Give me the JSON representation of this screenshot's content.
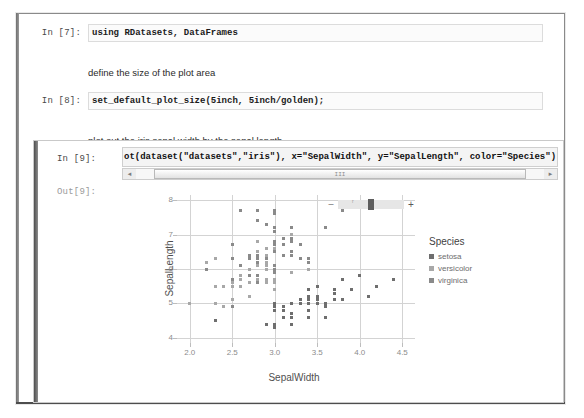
{
  "notebook": {
    "cells": [
      {
        "prompt": "In [7]:",
        "type": "code",
        "source": "using RDatasets, DataFrames"
      },
      {
        "prompt": "",
        "type": "markdown",
        "source": "define the size of the plot area"
      },
      {
        "prompt": "In [8]:",
        "type": "code",
        "source": "set_default_plot_size(5inch, 5inch/golden);"
      },
      {
        "prompt": "",
        "type": "markdown",
        "source": "plot out the iris sepal width by the sepal length"
      }
    ],
    "active_cell": {
      "prompt": "In [9]:",
      "source": "ot(dataset(\"datasets\",\"iris\"), x=\"SepalWidth\", y=\"SepalLength\", color=\"Species\")",
      "output_prompt": "Out[9]:",
      "scrollbar": {
        "left_arrow": "◄",
        "right_arrow": "►",
        "grip": "III"
      }
    }
  },
  "plot_controls": {
    "zoom_out_label": "–",
    "zoom_in_label": "+",
    "slider_name": "zoom-slider"
  },
  "chart_data": {
    "type": "scatter",
    "title": "",
    "xlabel": "SepalWidth",
    "ylabel": "SepalLength",
    "xlim": [
      1.85,
      4.65
    ],
    "ylim": [
      3.85,
      8.15
    ],
    "xticks": [
      "2.0",
      "2.5",
      "3.0",
      "3.5",
      "4.0",
      "4.5"
    ],
    "xtick_values": [
      2.0,
      2.5,
      3.0,
      3.5,
      4.0,
      4.5
    ],
    "yticks": [
      "4",
      "5",
      "6",
      "7",
      "8"
    ],
    "ytick_values": [
      4,
      5,
      6,
      7,
      8
    ],
    "grid": true,
    "legend": {
      "title": "Species",
      "position": "right",
      "entries": [
        {
          "label": "setosa",
          "color": "#6e6e6e"
        },
        {
          "label": "versicolor",
          "color": "#a8a8a8"
        },
        {
          "label": "virginica",
          "color": "#8a8a8a"
        }
      ]
    },
    "series": [
      {
        "name": "setosa",
        "color": "#6e6e6e",
        "points": [
          [
            3.5,
            5.1
          ],
          [
            3.0,
            4.9
          ],
          [
            3.2,
            4.7
          ],
          [
            3.1,
            4.6
          ],
          [
            3.6,
            5.0
          ],
          [
            3.9,
            5.4
          ],
          [
            3.4,
            4.6
          ],
          [
            3.4,
            5.0
          ],
          [
            2.9,
            4.4
          ],
          [
            3.1,
            4.9
          ],
          [
            3.7,
            5.4
          ],
          [
            3.4,
            4.8
          ],
          [
            3.0,
            4.8
          ],
          [
            3.0,
            4.3
          ],
          [
            4.0,
            5.8
          ],
          [
            4.4,
            5.7
          ],
          [
            3.9,
            5.4
          ],
          [
            3.5,
            5.1
          ],
          [
            3.8,
            5.7
          ],
          [
            3.8,
            5.1
          ],
          [
            3.4,
            5.4
          ],
          [
            3.7,
            5.1
          ],
          [
            3.6,
            4.6
          ],
          [
            3.3,
            5.1
          ],
          [
            3.4,
            4.8
          ],
          [
            3.0,
            5.0
          ],
          [
            3.4,
            5.0
          ],
          [
            3.5,
            5.2
          ],
          [
            3.4,
            5.2
          ],
          [
            3.2,
            4.7
          ],
          [
            3.1,
            4.8
          ],
          [
            3.4,
            5.4
          ],
          [
            4.1,
            5.2
          ],
          [
            4.2,
            5.5
          ],
          [
            3.1,
            4.9
          ],
          [
            3.2,
            5.0
          ],
          [
            3.5,
            5.5
          ],
          [
            3.6,
            4.9
          ],
          [
            3.0,
            4.4
          ],
          [
            3.4,
            5.1
          ],
          [
            3.5,
            5.0
          ],
          [
            2.3,
            4.5
          ],
          [
            3.2,
            4.4
          ],
          [
            3.5,
            5.0
          ],
          [
            3.8,
            5.1
          ],
          [
            3.0,
            4.8
          ],
          [
            3.8,
            5.1
          ],
          [
            3.2,
            4.6
          ],
          [
            3.7,
            5.3
          ],
          [
            3.3,
            5.0
          ]
        ]
      },
      {
        "name": "versicolor",
        "color": "#a8a8a8",
        "points": [
          [
            3.2,
            7.0
          ],
          [
            3.2,
            6.4
          ],
          [
            3.1,
            6.9
          ],
          [
            2.3,
            5.5
          ],
          [
            2.8,
            6.5
          ],
          [
            2.8,
            5.7
          ],
          [
            3.3,
            6.3
          ],
          [
            2.4,
            4.9
          ],
          [
            2.9,
            6.6
          ],
          [
            2.7,
            5.2
          ],
          [
            2.0,
            5.0
          ],
          [
            3.0,
            5.9
          ],
          [
            2.2,
            6.0
          ],
          [
            2.9,
            6.1
          ],
          [
            2.9,
            5.6
          ],
          [
            3.1,
            6.7
          ],
          [
            3.0,
            5.6
          ],
          [
            2.7,
            5.8
          ],
          [
            2.2,
            6.2
          ],
          [
            2.5,
            5.6
          ],
          [
            3.2,
            5.9
          ],
          [
            2.8,
            6.1
          ],
          [
            2.5,
            6.3
          ],
          [
            2.8,
            6.1
          ],
          [
            2.9,
            6.4
          ],
          [
            3.0,
            6.6
          ],
          [
            2.8,
            6.8
          ],
          [
            3.0,
            6.7
          ],
          [
            2.9,
            6.0
          ],
          [
            2.6,
            5.7
          ],
          [
            2.4,
            5.5
          ],
          [
            2.4,
            5.5
          ],
          [
            2.7,
            5.8
          ],
          [
            2.7,
            6.0
          ],
          [
            3.0,
            5.4
          ],
          [
            3.4,
            6.0
          ],
          [
            3.1,
            6.7
          ],
          [
            2.3,
            6.3
          ],
          [
            3.0,
            5.6
          ],
          [
            2.5,
            5.5
          ],
          [
            2.6,
            5.5
          ],
          [
            3.0,
            6.1
          ],
          [
            2.6,
            5.8
          ],
          [
            2.3,
            5.0
          ],
          [
            2.7,
            5.6
          ],
          [
            3.0,
            5.7
          ],
          [
            2.9,
            5.7
          ],
          [
            2.9,
            6.2
          ],
          [
            2.5,
            5.1
          ],
          [
            2.8,
            5.7
          ]
        ]
      },
      {
        "name": "virginica",
        "color": "#8a8a8a",
        "points": [
          [
            3.3,
            6.3
          ],
          [
            2.7,
            5.8
          ],
          [
            3.0,
            7.1
          ],
          [
            2.9,
            6.3
          ],
          [
            3.0,
            6.5
          ],
          [
            3.0,
            7.6
          ],
          [
            2.5,
            4.9
          ],
          [
            2.9,
            7.3
          ],
          [
            2.5,
            6.7
          ],
          [
            3.6,
            7.2
          ],
          [
            3.2,
            6.5
          ],
          [
            2.7,
            6.4
          ],
          [
            3.0,
            6.8
          ],
          [
            2.5,
            5.7
          ],
          [
            2.8,
            5.8
          ],
          [
            3.2,
            6.4
          ],
          [
            3.0,
            6.5
          ],
          [
            3.8,
            7.7
          ],
          [
            2.6,
            7.7
          ],
          [
            2.2,
            6.0
          ],
          [
            3.2,
            6.9
          ],
          [
            2.8,
            5.6
          ],
          [
            2.8,
            7.7
          ],
          [
            2.7,
            6.3
          ],
          [
            3.3,
            6.7
          ],
          [
            3.2,
            7.2
          ],
          [
            2.8,
            6.2
          ],
          [
            3.0,
            6.1
          ],
          [
            2.8,
            6.4
          ],
          [
            3.0,
            7.2
          ],
          [
            2.8,
            7.4
          ],
          [
            3.8,
            7.9
          ],
          [
            2.8,
            6.4
          ],
          [
            2.8,
            6.3
          ],
          [
            2.6,
            6.1
          ],
          [
            3.0,
            7.7
          ],
          [
            3.4,
            6.3
          ],
          [
            3.1,
            6.4
          ],
          [
            3.0,
            6.0
          ],
          [
            3.1,
            6.9
          ],
          [
            3.1,
            6.7
          ],
          [
            3.1,
            6.9
          ],
          [
            2.7,
            5.8
          ],
          [
            3.2,
            6.8
          ],
          [
            3.3,
            6.7
          ],
          [
            3.0,
            6.7
          ],
          [
            2.5,
            6.3
          ],
          [
            3.0,
            6.5
          ],
          [
            3.4,
            6.2
          ],
          [
            3.0,
            5.9
          ]
        ]
      }
    ]
  }
}
